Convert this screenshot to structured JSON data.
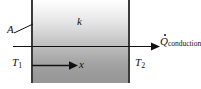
{
  "figure": {
    "type": "heat-conduction-through-plane-wall",
    "width": 201,
    "height": 89,
    "background_color": "#ffffff"
  },
  "slab": {
    "name": "plane wall",
    "fill_top_color": "#ffffff",
    "fill_bottom_color": "#979797",
    "edge_color": "#3b3b3b"
  },
  "labels": {
    "area": "A",
    "conductivity": "k",
    "temperature_hot": "T",
    "temperature_hot_sub": "1",
    "temperature_cold": "T",
    "temperature_cold_sub": "2",
    "axis": "x",
    "heat_rate_symbol": "Q",
    "heat_rate_sub": "conduction"
  },
  "arrows": {
    "heat_flow_direction": "right",
    "axis_direction": "right",
    "stroke_color": "#111111"
  }
}
